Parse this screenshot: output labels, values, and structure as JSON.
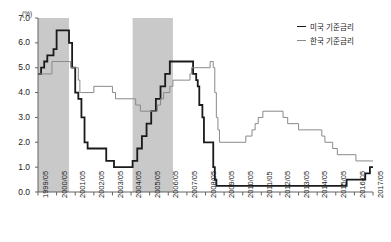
{
  "chart_data": {
    "type": "line",
    "title": "",
    "subtitle": "",
    "xlabel": "",
    "ylabel": "",
    "unit_label": "(%)",
    "ylim": [
      0.0,
      7.0
    ],
    "yticks": [
      "0.0",
      "1.0",
      "2.0",
      "3.0",
      "4.0",
      "5.0",
      "6.0",
      "7.0"
    ],
    "ytick_values": [
      0.0,
      1.0,
      2.0,
      3.0,
      4.0,
      5.0,
      6.0,
      7.0
    ],
    "grid": false,
    "legend_position": "right-top",
    "xlim": [
      "1999/05",
      "2017/05"
    ],
    "xticks": [
      "1999/05",
      "2000/05",
      "2001/05",
      "2002/05",
      "2003/05",
      "2004/05",
      "2005/05",
      "2006/05",
      "2007/05",
      "2008/05",
      "2009/05",
      "2010/05",
      "2011/05",
      "2012/05",
      "2013/05",
      "2014/05",
      "2015/05",
      "2016/05",
      "2017/05"
    ],
    "shaded_bands": [
      {
        "name": "us-tightening-band-1",
        "start": "1999/05",
        "end": "2001/01",
        "color": "#c9c9c9"
      },
      {
        "name": "us-tightening-band-2",
        "start": "2004/06",
        "end": "2006/08",
        "color": "#c9c9c9"
      }
    ],
    "series": [
      {
        "name": "미국 기준금리",
        "color": "#1a1a1a",
        "width": 1.8,
        "x": [
          "1999/05",
          "1999/07",
          "1999/09",
          "1999/11",
          "2000/01",
          "2000/03",
          "2000/05",
          "2000/07",
          "2000/11",
          "2001/01",
          "2001/03",
          "2001/05",
          "2001/07",
          "2001/09",
          "2001/11",
          "2002/01",
          "2002/11",
          "2003/01",
          "2003/06",
          "2004/06",
          "2004/09",
          "2004/12",
          "2005/03",
          "2005/06",
          "2005/09",
          "2005/12",
          "2006/03",
          "2006/06",
          "2006/09",
          "2007/08",
          "2007/09",
          "2007/11",
          "2007/12",
          "2008/01",
          "2008/03",
          "2008/04",
          "2008/10",
          "2008/11",
          "2008/12",
          "2009/06",
          "2015/12",
          "2016/06",
          "2016/12",
          "2017/03",
          "2017/05"
        ],
        "values": [
          4.75,
          5.0,
          5.25,
          5.5,
          5.5,
          5.75,
          6.5,
          6.5,
          6.5,
          6.0,
          5.0,
          4.0,
          3.75,
          3.0,
          2.0,
          1.75,
          1.75,
          1.25,
          1.0,
          1.25,
          1.75,
          2.25,
          2.75,
          3.25,
          3.75,
          4.25,
          4.75,
          5.25,
          5.25,
          5.25,
          4.75,
          4.5,
          4.25,
          3.5,
          3.0,
          2.0,
          1.0,
          0.5,
          0.25,
          0.25,
          0.5,
          0.5,
          0.75,
          1.0,
          1.0
        ]
      },
      {
        "name": "한국 기준금리",
        "color": "#8a8a8a",
        "width": 1.0,
        "x": [
          "1999/05",
          "1999/11",
          "2000/02",
          "2000/10",
          "2001/02",
          "2001/07",
          "2001/08",
          "2001/09",
          "2002/05",
          "2003/05",
          "2003/07",
          "2004/08",
          "2004/11",
          "2005/10",
          "2005/12",
          "2006/02",
          "2006/06",
          "2006/08",
          "2007/07",
          "2007/08",
          "2008/08",
          "2008/10",
          "2008/11",
          "2008/12",
          "2009/01",
          "2009/02",
          "2010/07",
          "2010/11",
          "2011/01",
          "2011/03",
          "2011/06",
          "2012/07",
          "2012/10",
          "2013/05",
          "2014/08",
          "2014/10",
          "2015/03",
          "2015/06",
          "2016/06",
          "2017/05"
        ],
        "values": [
          4.75,
          4.75,
          5.25,
          5.25,
          5.0,
          4.5,
          4.0,
          4.0,
          4.25,
          4.0,
          3.75,
          3.5,
          3.25,
          3.5,
          3.75,
          4.0,
          4.25,
          4.5,
          4.75,
          5.0,
          5.25,
          5.0,
          4.0,
          3.0,
          2.5,
          2.0,
          2.25,
          2.5,
          2.75,
          3.0,
          3.25,
          3.0,
          2.75,
          2.5,
          2.25,
          2.0,
          1.75,
          1.5,
          1.25,
          1.25
        ]
      }
    ]
  },
  "legend": {
    "items": [
      {
        "label": "미국 기준금리",
        "color": "#1a1a1a",
        "width": "1.8px"
      },
      {
        "label": "한국 기준금리",
        "color": "#8a8a8a",
        "width": "1.2px"
      }
    ]
  }
}
